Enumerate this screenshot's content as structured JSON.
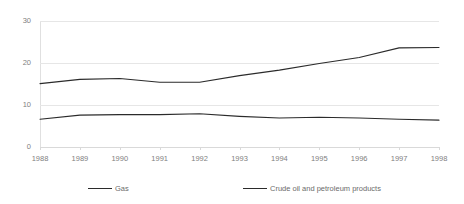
{
  "chart_data": {
    "type": "line",
    "title": "",
    "subtitle": "",
    "xlabel": "",
    "ylabel": "",
    "categories": [
      "1988",
      "1989",
      "1990",
      "1991",
      "1992",
      "1993",
      "1994",
      "1995",
      "1996",
      "1997",
      "1998"
    ],
    "x": [
      1988,
      1989,
      1990,
      1991,
      1992,
      1993,
      1994,
      1995,
      1996,
      1997,
      1998
    ],
    "series": [
      {
        "name": "Gas",
        "values": [
          6.6,
          7.6,
          7.7,
          7.7,
          7.9,
          7.3,
          6.9,
          7.1,
          6.9,
          6.6,
          6.4
        ]
      },
      {
        "name": "Crude oil and petroleum products",
        "values": [
          15.1,
          16.1,
          16.3,
          15.4,
          15.4,
          17.0,
          18.3,
          19.9,
          21.3,
          23.6,
          23.7
        ]
      }
    ],
    "ylim": [
      0,
      30
    ],
    "yticks": [
      0,
      10,
      20,
      30
    ],
    "ytick_labels": [
      "0",
      "10",
      "20",
      "30"
    ],
    "grid": true,
    "grid_axis": "y",
    "legend_position": "bottom",
    "line_color": "#2b2b2b",
    "grid_color": "#e6e6e6",
    "tick_label_color": "#808080"
  },
  "legend": {
    "items": [
      {
        "label": "Gas"
      },
      {
        "label": "Crude oil and petroleum products"
      }
    ]
  }
}
